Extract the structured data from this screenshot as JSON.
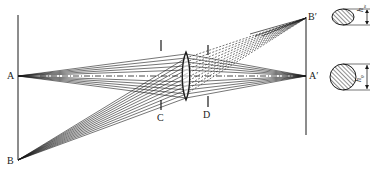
{
  "diagram": {
    "type": "optical ray diagram",
    "labels": {
      "object_axis_point": "A",
      "object_offaxis_point": "B",
      "image_axis_point": "A′",
      "image_offaxis_point": "B′",
      "stop_front": "C",
      "stop_rear": "D",
      "pupil_height_offaxis": "h",
      "pupil_height_offaxis_sub": "w",
      "pupil_height_axis": "h",
      "pupil_height_axis_sub": "0"
    },
    "colors": {
      "line": "#1a1a1a",
      "background": "#ffffff",
      "hatch": "#333333"
    }
  }
}
